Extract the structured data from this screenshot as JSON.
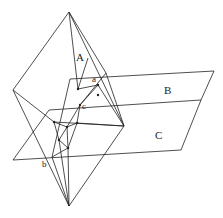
{
  "labels": {
    "A": "A",
    "B": "B",
    "C": "C",
    "a": "a",
    "b": "b",
    "c": "c"
  },
  "colors": {
    "stroke": "#222222",
    "background": "#ffffff"
  }
}
